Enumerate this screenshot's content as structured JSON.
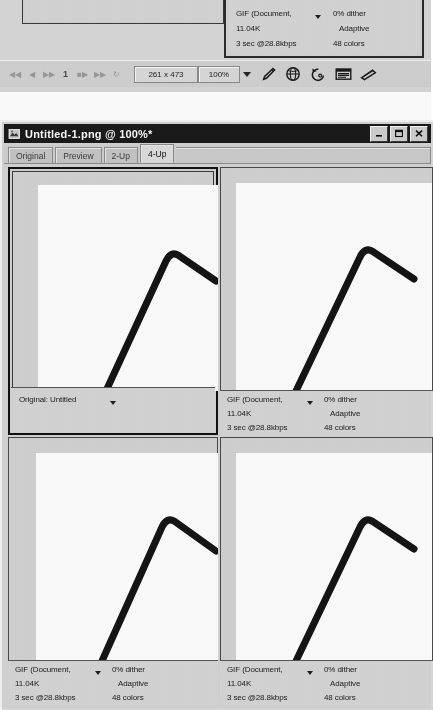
{
  "window": {
    "title": "Untitled-1.png @ 100%*",
    "app_icon": "imageready-icon",
    "buttons": {
      "minimize": "minimize-icon",
      "maximize": "maximize-icon",
      "close": "close-icon"
    }
  },
  "tabs": [
    {
      "label": "Original",
      "active": false
    },
    {
      "label": "Preview",
      "active": false
    },
    {
      "label": "2-Up",
      "active": false
    },
    {
      "label": "4-Up",
      "active": true
    }
  ],
  "panes": {
    "original": {
      "label": "Original: Untitled",
      "has_dropdown": true
    },
    "optimized": {
      "format": "GIF (Document,",
      "dither": "0% dither",
      "filesize": "11.04K",
      "palette": "Adaptive",
      "download_time": "3 sec @28.8kbps",
      "colors": "48 colors",
      "has_dropdown": true
    }
  },
  "grid": {
    "cells": [
      {
        "name": "pane-original",
        "kind": "original",
        "selected": true
      },
      {
        "name": "pane-optimized-1",
        "kind": "optimized",
        "selected": false
      },
      {
        "name": "pane-optimized-2",
        "kind": "optimized",
        "selected": false
      },
      {
        "name": "pane-optimized-3",
        "kind": "optimized",
        "selected": false
      }
    ]
  },
  "statusbar": {
    "dimensions": "261 x 473",
    "zoom": "100%",
    "nav_buttons": [
      "first-frame-icon",
      "previous-frame-icon",
      "play-icon",
      "frame-number",
      "stop-icon",
      "next-frame-icon",
      "loop-icon"
    ],
    "frame_number": "1",
    "tools": [
      "eyedropper-icon",
      "preview-in-browser-icon",
      "rollover-icon",
      "browser-select-icon",
      "jump-to-icon"
    ]
  },
  "colors": {
    "titlebar": "#1a1a1a",
    "face": "#d4d4d4",
    "canvas": "#ffffff",
    "stroke": "#111111",
    "border": "#4a4a4a"
  }
}
